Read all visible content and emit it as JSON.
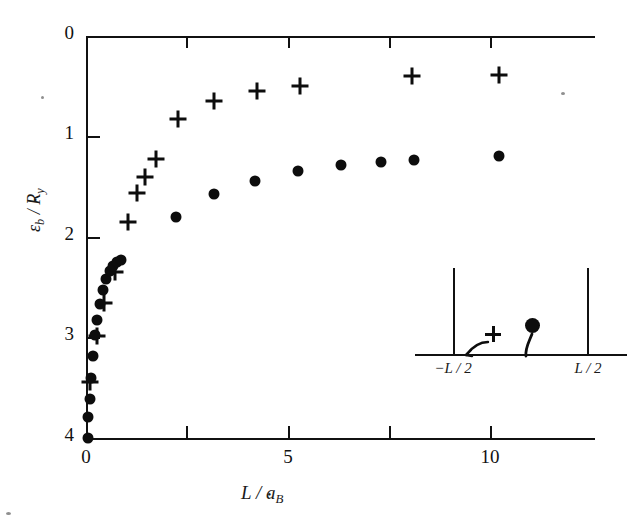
{
  "figure": {
    "background_color": "#ffffff",
    "ink_color": "#111111"
  },
  "axes": {
    "x": {
      "label": "L / a",
      "label_sub": "B",
      "min": 0,
      "max": 12.5,
      "ticks": [
        0,
        2.5,
        5,
        7.5,
        10,
        12.5
      ],
      "tick_labels": [
        "0",
        "",
        "5",
        "",
        "10",
        ""
      ]
    },
    "y": {
      "label_num": "ε",
      "label_num_sub": "b",
      "label_den": "R",
      "label_den_sub": "y",
      "min": 0,
      "max": 4,
      "inverted": true,
      "ticks": [
        0,
        1,
        2,
        3,
        4
      ],
      "tick_labels": [
        "0",
        "1",
        "2",
        "3",
        "4"
      ]
    }
  },
  "inset": {
    "left_wall_label": "−L / 2",
    "right_wall_label": "L / 2",
    "hole_symbol": "+",
    "electron_symbol": "●"
  },
  "chart_data": {
    "type": "scatter",
    "title": "",
    "xlabel": "L / a_B*",
    "ylabel": "ε_b / R_y*",
    "xlim": [
      0,
      12.5
    ],
    "ylim": [
      0,
      4
    ],
    "y_inverted": true,
    "grid": false,
    "legend": null,
    "series": [
      {
        "name": "plus",
        "marker": "+",
        "points": [
          [
            0.1,
            3.44
          ],
          [
            0.28,
            2.98
          ],
          [
            0.45,
            2.66
          ],
          [
            0.72,
            2.35
          ],
          [
            1.02,
            1.85
          ],
          [
            1.25,
            1.56
          ],
          [
            1.45,
            1.4
          ],
          [
            1.72,
            1.22
          ],
          [
            2.25,
            0.83
          ],
          [
            3.15,
            0.65
          ],
          [
            4.2,
            0.55
          ],
          [
            5.25,
            0.5
          ],
          [
            8.0,
            0.4
          ],
          [
            10.15,
            0.39
          ]
        ]
      },
      {
        "name": "dot",
        "marker": "●",
        "points": [
          [
            0.04,
            4.0
          ],
          [
            0.06,
            3.79
          ],
          [
            0.09,
            3.61
          ],
          [
            0.13,
            3.4
          ],
          [
            0.17,
            3.18
          ],
          [
            0.22,
            2.97
          ],
          [
            0.28,
            2.83
          ],
          [
            0.34,
            2.67
          ],
          [
            0.41,
            2.53
          ],
          [
            0.5,
            2.42
          ],
          [
            0.58,
            2.34
          ],
          [
            0.66,
            2.29
          ],
          [
            0.75,
            2.25
          ],
          [
            0.86,
            2.23
          ],
          [
            2.2,
            1.8
          ],
          [
            3.15,
            1.57
          ],
          [
            4.15,
            1.44
          ],
          [
            5.2,
            1.34
          ],
          [
            6.25,
            1.28
          ],
          [
            7.25,
            1.25
          ],
          [
            8.05,
            1.23
          ],
          [
            10.15,
            1.19
          ]
        ]
      }
    ]
  }
}
